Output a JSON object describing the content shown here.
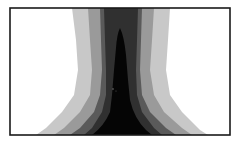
{
  "figure": {
    "type": "grayscale contour field",
    "frame": {
      "x": 10,
      "y": 8,
      "width": 220,
      "height": 127
    },
    "colors": {
      "background": "#ffffff",
      "frame": "#1a1a1a",
      "band_lightest": "#c8c8c8",
      "band_light": "#9a9a9a",
      "band_mid": "#5a5a5a",
      "band_dark": "#303030",
      "core": "#050505"
    }
  }
}
